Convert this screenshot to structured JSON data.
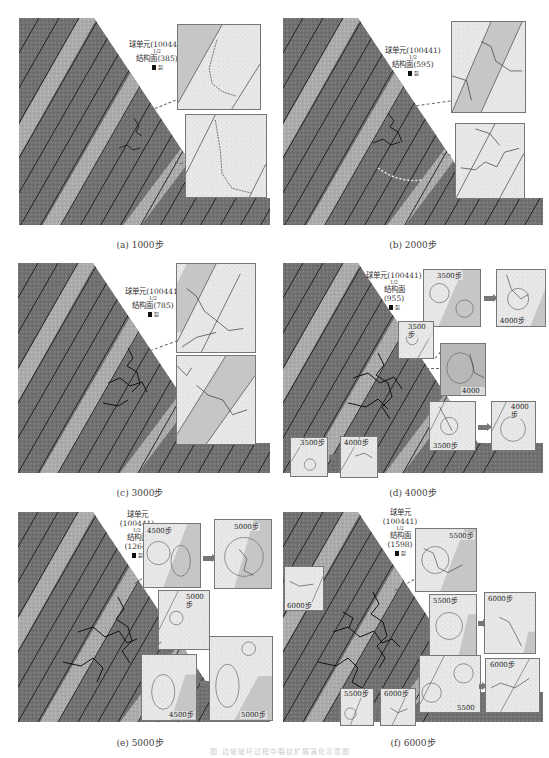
{
  "figure": {
    "type": "PFC slope cracking evolution, 6 panels",
    "legend_common": {
      "ball_label": "球单元",
      "ball_count": "100441",
      "ratio_top": "1",
      "ratio_bottom": "2",
      "joint_label": "结构面",
      "black_mark_label": "裂"
    },
    "colors": {
      "rock_dark": "#6e6e6e",
      "rock_light_band": "#a9a9a9",
      "joint_line": "#1a1a1a",
      "crack": "#111111",
      "inset_bg": "#e6e6e6",
      "inset_band": "#c4c4c4",
      "leader": "#666666",
      "arrow": "#777777"
    },
    "panels": [
      {
        "id": "a",
        "caption": "(a) 1000步",
        "joint_count": "385",
        "legend_text_ball": "球单元(100441)",
        "legend_text_joint": "结构面(385)",
        "insets": []
      },
      {
        "id": "b",
        "caption": "(b) 2000步",
        "joint_count": "595",
        "legend_text_ball": "球单元(100441)",
        "legend_text_joint": "结构面(595)",
        "insets": []
      },
      {
        "id": "c",
        "caption": "(c) 3000步",
        "joint_count": "785",
        "legend_text_ball": "球单元(100441)",
        "legend_text_joint": "结构面(785)",
        "insets": []
      },
      {
        "id": "d",
        "caption": "(d) 4000步",
        "joint_count": "955",
        "legend_text_ball": "球单元(100441)",
        "legend_text_joint": "结构面",
        "legend_text_joint_count": "(955)",
        "insets": [
          {
            "label": "3500步"
          },
          {
            "label": "4000步"
          },
          {
            "label": "3500步"
          },
          {
            "label": "4000步"
          },
          {
            "label": "3500步"
          },
          {
            "label": "4000步"
          },
          {
            "label": "3500步"
          },
          {
            "label": "4000步"
          }
        ]
      },
      {
        "id": "e",
        "caption": "(e) 5000步",
        "joint_count": "1264",
        "legend_text_ball": "球单元",
        "legend_text_ball_count": "(100441)",
        "legend_text_joint": "结构面",
        "legend_text_joint_count": "(1264)",
        "insets": [
          {
            "label": "4500步"
          },
          {
            "label": "5000步"
          },
          {
            "label": "5000步"
          },
          {
            "label": "4500步"
          },
          {
            "label": "5000步"
          }
        ]
      },
      {
        "id": "f",
        "caption": "(f) 6000步",
        "joint_count": "1598",
        "legend_text_ball": "球单元",
        "legend_text_ball_count": "(100441)",
        "legend_text_joint": "结构面",
        "legend_text_joint_count": "(1598)",
        "insets": [
          {
            "label": "6000步"
          },
          {
            "label": "5500步"
          },
          {
            "label": "5500步"
          },
          {
            "label": "6000步"
          },
          {
            "label": "5500步"
          },
          {
            "label": "6000步"
          },
          {
            "label": "5500步"
          },
          {
            "label": "6000步"
          }
        ]
      }
    ],
    "figure_caption": "图  边坡破坏过程中裂纹扩展演化示意图"
  }
}
